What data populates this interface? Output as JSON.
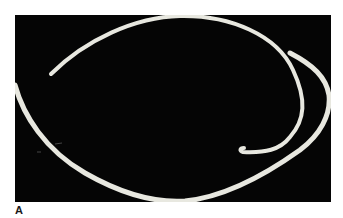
{
  "figure": {
    "panel_label": "A",
    "background_color": "#050505",
    "strand_color": "#e8e8e0"
  }
}
